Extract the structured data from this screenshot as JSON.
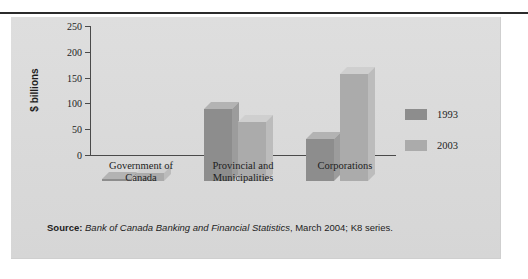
{
  "chart_data": {
    "type": "bar",
    "title": "",
    "xlabel": "",
    "ylabel": "$ billions",
    "ylim": [
      0,
      250
    ],
    "yticks": [
      0,
      50,
      100,
      150,
      200,
      250
    ],
    "grid": false,
    "legend_position": "right",
    "categories": [
      "Government of Canada",
      "Provincial and Municipalities",
      "Corporations"
    ],
    "category_lines": [
      [
        "Government of",
        "Canada"
      ],
      [
        "Provincial and",
        "Municipalities"
      ],
      [
        "Corporations"
      ]
    ],
    "series": [
      {
        "name": "1993",
        "color": "#8d8d8d",
        "values": [
          3,
          140,
          81
        ]
      },
      {
        "name": "2003",
        "color": "#ababab",
        "values": [
          16,
          115,
          207
        ]
      }
    ],
    "units": "$ billions"
  },
  "source": {
    "prefix": "Source:",
    "publication": "Bank of Canada Banking and Financial Statistics",
    "detail": ", March 2004; K8 series."
  },
  "colors": {
    "panel_background": "#dcdcdc",
    "rule": "#2b2b2b",
    "axis": "#4a4a4a",
    "series_1993": "#8d8d8d",
    "series_2003": "#ababab",
    "text": "#1d1d1d"
  }
}
